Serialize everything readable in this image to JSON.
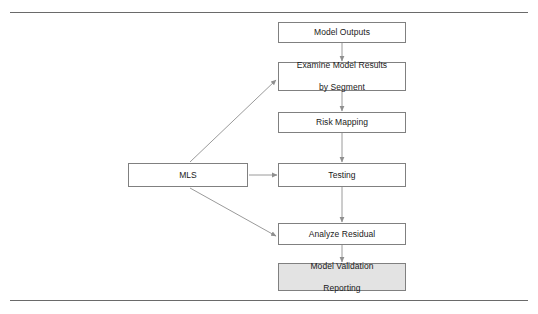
{
  "diagram": {
    "type": "flowchart",
    "colors": {
      "node_border": "#808080",
      "node_fill": "#ffffff",
      "node_fill_shaded": "#e3e3e3",
      "connector": "#9a9a9a",
      "rule": "#6a6a6a",
      "text": "#1a1a1a"
    },
    "rules": {
      "top_label": "top-divider-rule",
      "bottom_label": "bottom-divider-rule"
    },
    "nodes": [
      {
        "id": "model-outputs",
        "label": "Model Outputs",
        "line1": "Model Outputs",
        "line2": "",
        "shaded": false
      },
      {
        "id": "examine-results",
        "label": "Examine Model Results by Segment",
        "line1": "Examine Model Results",
        "line2": "by Segment",
        "shaded": false
      },
      {
        "id": "risk-mapping",
        "label": "Risk Mapping",
        "line1": "Risk Mapping",
        "line2": "",
        "shaded": false
      },
      {
        "id": "testing",
        "label": "Testing",
        "line1": "Testing",
        "line2": "",
        "shaded": false
      },
      {
        "id": "analyze-residual",
        "label": "Analyze Residual",
        "line1": "Analyze Residual",
        "line2": "",
        "shaded": false
      },
      {
        "id": "model-validation",
        "label": "Model Validation Reporting",
        "line1": "Model Validation",
        "line2": "Reporting",
        "shaded": true
      },
      {
        "id": "mls",
        "label": "MLS",
        "line1": "MLS",
        "line2": "",
        "shaded": false
      }
    ],
    "edges": [
      {
        "id": "model-outputs-to-examine-results",
        "from": "model-outputs",
        "to": "examine-results",
        "style": "vertical-arrow"
      },
      {
        "id": "examine-results-to-risk-mapping",
        "from": "examine-results",
        "to": "risk-mapping",
        "style": "vertical-arrow"
      },
      {
        "id": "risk-mapping-to-testing",
        "from": "risk-mapping",
        "to": "testing",
        "style": "vertical-arrow"
      },
      {
        "id": "testing-to-analyze-residual",
        "from": "testing",
        "to": "analyze-residual",
        "style": "vertical-arrow"
      },
      {
        "id": "analyze-residual-to-model-validation",
        "from": "analyze-residual",
        "to": "model-validation",
        "style": "vertical-arrow"
      },
      {
        "id": "mls-to-testing",
        "from": "mls",
        "to": "testing",
        "style": "horizontal-arrow"
      },
      {
        "id": "mls-to-examine-results",
        "from": "mls",
        "to": "examine-results",
        "style": "diagonal-arrow-up"
      },
      {
        "id": "mls-to-analyze-residual",
        "from": "mls",
        "to": "analyze-residual",
        "style": "diagonal-arrow-down"
      }
    ]
  }
}
